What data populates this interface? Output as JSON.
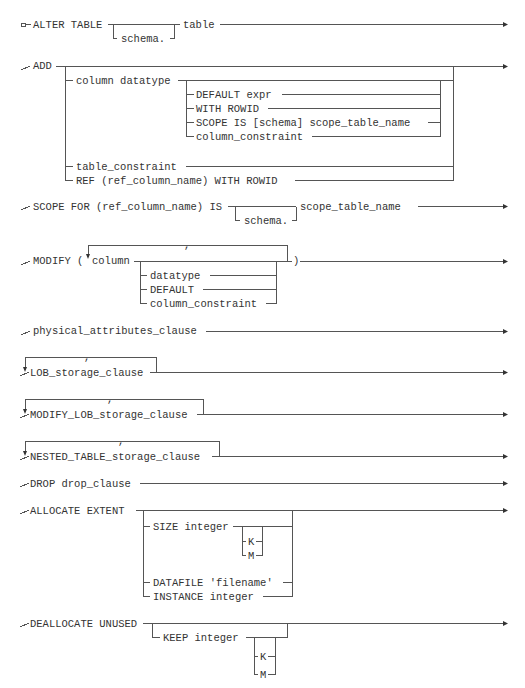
{
  "diagram": {
    "row1": {
      "keyword": "ALTER TABLE",
      "schema": "schema.",
      "table": "table"
    },
    "row2": {
      "keyword": "ADD",
      "column_datatype": "column datatype",
      "options": [
        "DEFAULT expr",
        "WITH ROWID",
        "SCOPE IS [schema] scope_table_name",
        "column_constraint"
      ],
      "table_constraint": "table_constraint",
      "ref": "REF (ref_column_name) WITH ROWID"
    },
    "row3": {
      "keyword": "SCOPE FOR (ref_column_name) IS",
      "schema": "schema.",
      "name": "scope_table_name"
    },
    "row4": {
      "keyword": "MODIFY (",
      "column": "column",
      "separator": ",",
      "options": [
        "datatype",
        "DEFAULT",
        "column_constraint"
      ],
      "close": ")"
    },
    "row5": {
      "keyword": "physical_attributes_clause"
    },
    "row6": {
      "keyword": "LOB_storage_clause",
      "separator": ","
    },
    "row7": {
      "keyword": "MODIFY_LOB_storage_clause",
      "separator": ","
    },
    "row8": {
      "keyword": "NESTED_TABLE_storage_clause",
      "separator": ","
    },
    "row9": {
      "keyword": "DROP drop_clause"
    },
    "row10": {
      "keyword": "ALLOCATE EXTENT",
      "size": "SIZE integer",
      "units": [
        "K",
        "M"
      ],
      "datafile": "DATAFILE 'filename'",
      "instance": "INSTANCE integer"
    },
    "row11": {
      "keyword": "DEALLOCATE UNUSED",
      "keep": "KEEP integer",
      "units": [
        "K",
        "M"
      ]
    }
  }
}
